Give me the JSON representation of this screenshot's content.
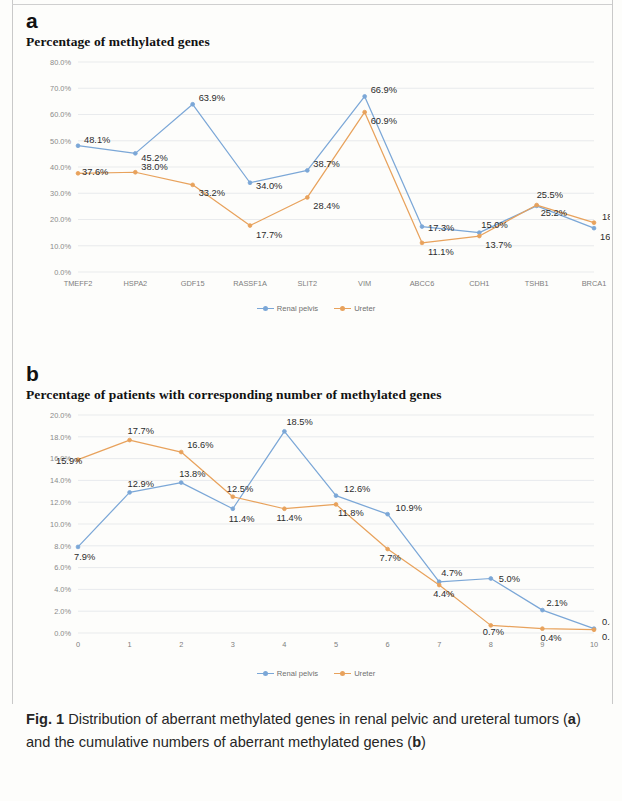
{
  "figure": {
    "caption_prefix": "Fig. 1",
    "caption_part1": " Distribution of aberrant methylated genes in renal pelvic and ureteral tumors (",
    "caption_bold_a": "a",
    "caption_part2": ") and the cumulative numbers of aberrant methylated genes (",
    "caption_bold_b": "b",
    "caption_part3": ")"
  },
  "legend": {
    "renal_pelvis": "Renal pelvis",
    "ureter": "Ureter"
  },
  "colors": {
    "renal_pelvis": "#7ba7d7",
    "ureter": "#e8a25c",
    "grid": "#dfe3e6",
    "tick_text": "#8a8a8a",
    "label_text": "#2b2b2b"
  },
  "panel_a": {
    "letter": "a",
    "title": "Percentage of methylated genes"
  },
  "panel_b": {
    "letter": "b",
    "title": "Percentage of patients with corresponding number of methylated genes"
  },
  "chart_data": [
    {
      "id": "chart-a",
      "type": "line",
      "title": "Percentage of methylated genes",
      "xlabel": "",
      "ylabel": "",
      "ylim": [
        0,
        80
      ],
      "ytick_step": 10,
      "ytick_labels": [
        "0.0%",
        "10.0%",
        "20.0%",
        "30.0%",
        "40.0%",
        "50.0%",
        "60.0%",
        "70.0%",
        "80.0%"
      ],
      "grid": true,
      "legend_position": "bottom",
      "categories": [
        "TMEFF2",
        "HSPA2",
        "GDF15",
        "RASSF1A",
        "SLIT2",
        "VIM",
        "ABCC6",
        "CDH1",
        "TSHB1",
        "BRCA1"
      ],
      "series": [
        {
          "name": "Renal pelvis",
          "color": "#7ba7d7",
          "values": [
            48.1,
            45.2,
            63.9,
            34.0,
            38.7,
            66.9,
            17.3,
            15.0,
            25.2,
            16.7
          ],
          "labels": [
            "48.1%",
            "45.2%",
            "63.9%",
            "34.0%",
            "38.7%",
            "66.9%",
            "17.3%",
            "15.0%",
            "25.2%",
            "16.7%"
          ]
        },
        {
          "name": "Ureter",
          "color": "#e8a25c",
          "values": [
            37.6,
            38.0,
            33.2,
            17.7,
            28.4,
            60.9,
            11.1,
            13.7,
            25.5,
            18.8
          ],
          "labels": [
            "37.6%",
            "38.0%",
            "33.2%",
            "17.7%",
            "28.4%",
            "60.9%",
            "11.1%",
            "13.7%",
            "25.5%",
            "18.8%"
          ]
        }
      ]
    },
    {
      "id": "chart-b",
      "type": "line",
      "title": "Percentage of patients with corresponding number of methylated genes",
      "xlabel": "",
      "ylabel": "",
      "ylim": [
        0,
        20
      ],
      "ytick_step": 2,
      "ytick_labels": [
        "0.0%",
        "2.0%",
        "4.0%",
        "6.0%",
        "8.0%",
        "10.0%",
        "12.0%",
        "14.0%",
        "16.0%",
        "18.0%",
        "20.0%"
      ],
      "grid": true,
      "legend_position": "bottom",
      "categories": [
        "0",
        "1",
        "2",
        "3",
        "4",
        "5",
        "6",
        "7",
        "8",
        "9",
        "10"
      ],
      "series": [
        {
          "name": "Renal pelvis",
          "color": "#7ba7d7",
          "values": [
            7.9,
            12.9,
            13.8,
            11.4,
            18.5,
            12.6,
            10.9,
            4.7,
            5.0,
            2.1,
            0.4
          ],
          "labels": [
            "7.9%",
            "12.9%",
            "13.8%",
            "11.4%",
            "18.5%",
            "12.6%",
            "10.9%",
            "4.7%",
            "5.0%",
            "2.1%",
            "0.4%"
          ]
        },
        {
          "name": "Ureter",
          "color": "#e8a25c",
          "values": [
            15.9,
            17.7,
            16.6,
            12.5,
            11.4,
            11.8,
            7.7,
            4.4,
            0.7,
            0.4,
            0.3
          ],
          "labels": [
            "15.9%",
            "17.7%",
            "16.6%",
            "12.5%",
            "11.4%",
            "11.8%",
            "7.7%",
            "4.4%",
            "0.7%",
            "0.4%",
            "0.3%"
          ]
        }
      ]
    }
  ]
}
